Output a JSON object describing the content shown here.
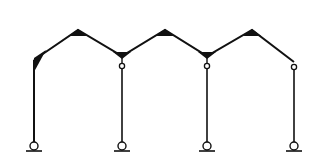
{
  "diagram": {
    "type": "structural-frame",
    "colors": {
      "line": "#111111",
      "background": "#ffffff",
      "hinge_fill": "#ffffff"
    },
    "roof_nodes": [
      {
        "id": "knee-left",
        "x": 34,
        "y": 60
      },
      {
        "id": "ridge-1",
        "x": 78,
        "y": 30
      },
      {
        "id": "valley-1",
        "x": 122,
        "y": 56
      },
      {
        "id": "ridge-2",
        "x": 165,
        "y": 30
      },
      {
        "id": "valley-2",
        "x": 207,
        "y": 56
      },
      {
        "id": "ridge-3",
        "x": 252,
        "y": 30
      },
      {
        "id": "end-right",
        "x": 294,
        "y": 62
      }
    ],
    "columns": [
      {
        "id": "column-1",
        "x": 34,
        "top": 60,
        "bottom": 142,
        "hinge_top": false
      },
      {
        "id": "column-2",
        "x": 122,
        "top": 67,
        "bottom": 142,
        "hinge_top": true
      },
      {
        "id": "column-3",
        "x": 207,
        "top": 67,
        "bottom": 142,
        "hinge_top": true
      },
      {
        "id": "column-4",
        "x": 294,
        "top": 68,
        "bottom": 142,
        "hinge_top": true
      }
    ],
    "supports": [
      {
        "id": "support-1",
        "x": 34,
        "y": 146,
        "kind": "pin"
      },
      {
        "id": "support-2",
        "x": 122,
        "y": 146,
        "kind": "pin"
      },
      {
        "id": "support-3",
        "x": 207,
        "y": 146,
        "kind": "pin"
      },
      {
        "id": "support-4",
        "x": 294,
        "y": 146,
        "kind": "pin"
      }
    ]
  }
}
